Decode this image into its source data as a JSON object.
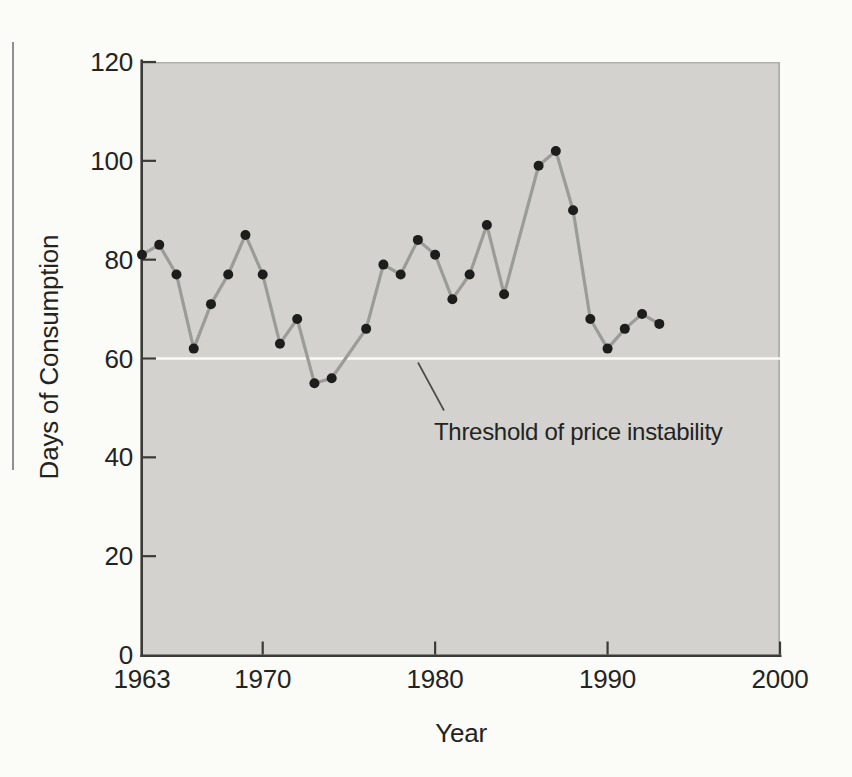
{
  "figure_caption": "",
  "chart_data": {
    "type": "line",
    "title": "",
    "xlabel": "Year",
    "ylabel": "Days of Consumption",
    "xlim": [
      1963,
      2000
    ],
    "ylim": [
      0,
      120
    ],
    "x_ticks": [
      1963,
      1970,
      1980,
      1990,
      2000
    ],
    "x_tick_labels": [
      "1963",
      "1970",
      "1980",
      "1990",
      "2000"
    ],
    "y_ticks": [
      0,
      20,
      40,
      60,
      80,
      100,
      120
    ],
    "grid": false,
    "legend": false,
    "series": [
      {
        "name": "Days of Consumption",
        "points": [
          [
            1963,
            81
          ],
          [
            1964,
            83
          ],
          [
            1965,
            77
          ],
          [
            1966,
            62
          ],
          [
            1967,
            71
          ],
          [
            1968,
            77
          ],
          [
            1969,
            85
          ],
          [
            1970,
            77
          ],
          [
            1971,
            63
          ],
          [
            1972,
            68
          ],
          [
            1973,
            55
          ],
          [
            1974,
            56
          ],
          [
            1976,
            66
          ],
          [
            1977,
            79
          ],
          [
            1978,
            77
          ],
          [
            1979,
            84
          ],
          [
            1980,
            81
          ],
          [
            1981,
            72
          ],
          [
            1982,
            77
          ],
          [
            1983,
            87
          ],
          [
            1984,
            73
          ],
          [
            1986,
            99
          ],
          [
            1987,
            102
          ],
          [
            1988,
            90
          ],
          [
            1989,
            68
          ],
          [
            1990,
            62
          ],
          [
            1991,
            66
          ],
          [
            1992,
            69
          ],
          [
            1993,
            67
          ]
        ]
      }
    ],
    "threshold": {
      "value": 60,
      "label": "Threshold of price instability"
    },
    "colors": {
      "page_background": "#fbfbf8",
      "plot_background": "#d3d2cf",
      "plot_border": "#aeaeab",
      "axis": "#3a3a36",
      "tick_text": "#24241f",
      "series_line": "#9b9b98",
      "marker": "#1d1d1b",
      "threshold_line": "#fafaf7",
      "pointer_line": "#4c4c48",
      "margin_rule": "#909092"
    }
  }
}
